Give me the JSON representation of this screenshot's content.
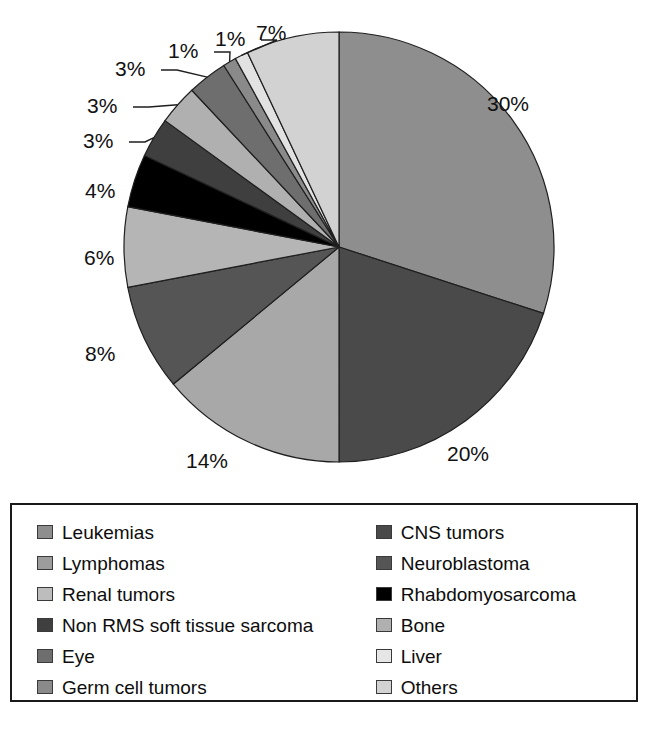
{
  "chart_data": {
    "type": "pie",
    "title": "",
    "subtitle": "",
    "xlabel": "",
    "ylabel": "",
    "grid": false,
    "legend_position": "bottom",
    "units": "percent",
    "start_angle_deg": 0,
    "direction": "clockwise",
    "categories": [
      "Leukemias",
      "CNS tumors",
      "Lymphomas",
      "Neuroblastoma",
      "Renal tumors",
      "Rhabdomyosarcoma",
      "Non RMS soft tissue sarcoma",
      "Bone",
      "Eye",
      "Germ cell tumors",
      "Liver",
      "Others"
    ],
    "values": [
      30,
      20,
      14,
      8,
      6,
      4,
      3,
      3,
      3,
      1,
      1,
      7
    ],
    "labels": [
      "30%",
      "20%",
      "14%",
      "8%",
      "6%",
      "4%",
      "3%",
      "3%",
      "3%",
      "1%",
      "1%",
      "7%"
    ],
    "colors": [
      "#8e8e8e",
      "#4a4a4a",
      "#a8a8a8",
      "#555555",
      "#b5b5b5",
      "#000000",
      "#3f3f3f",
      "#7a7a7a",
      "#6e6e6e",
      "#8a8a8a",
      "#e2e2e2",
      "#d2d2d2"
    ],
    "slices": [
      {
        "name": "Leukemias",
        "value": 30,
        "label": "30%",
        "color": "#8e8e8e"
      },
      {
        "name": "CNS tumors",
        "value": 20,
        "label": "20%",
        "color": "#4a4a4a"
      },
      {
        "name": "Lymphomas",
        "value": 14,
        "label": "14%",
        "color": "#a8a8a8"
      },
      {
        "name": "Neuroblastoma",
        "value": 8,
        "label": "8%",
        "color": "#555555"
      },
      {
        "name": "Renal tumors",
        "value": 6,
        "label": "6%",
        "color": "#b5b5b5"
      },
      {
        "name": "Rhabdomyosarcoma",
        "value": 4,
        "label": "4%",
        "color": "#000000"
      },
      {
        "name": "Non RMS soft tissue sarcoma",
        "value": 3,
        "label": "3%",
        "color": "#3f3f3f"
      },
      {
        "name": "Bone",
        "value": 3,
        "label": "3%",
        "color": "#b0b0b0"
      },
      {
        "name": "Eye",
        "value": 3,
        "label": "3%",
        "color": "#6e6e6e"
      },
      {
        "name": "Germ cell tumors",
        "value": 1,
        "label": "1%",
        "color": "#8a8a8a"
      },
      {
        "name": "Liver",
        "value": 1,
        "label": "1%",
        "color": "#e2e2e2"
      },
      {
        "name": "Others",
        "value": 7,
        "label": "7%",
        "color": "#d2d2d2"
      }
    ]
  },
  "pie": {
    "center_x": 339,
    "center_y": 247,
    "radius": 215,
    "outline_color": "#1f1f1f",
    "callout_labels": [
      {
        "text": "30%",
        "x": 487,
        "y": 93,
        "leader": false
      },
      {
        "text": "20%",
        "x": 447,
        "y": 443,
        "leader": false
      },
      {
        "text": "14%",
        "x": 186,
        "y": 450,
        "leader": false
      },
      {
        "text": "8%",
        "x": 85,
        "y": 343,
        "leader": false
      },
      {
        "text": "6%",
        "x": 84,
        "y": 247,
        "leader": false
      },
      {
        "text": "4%",
        "x": 85,
        "y": 180,
        "leader": false
      },
      {
        "text": "3%",
        "x": 83,
        "y": 130,
        "leader": true
      },
      {
        "text": "3%",
        "x": 87,
        "y": 95,
        "leader": true
      },
      {
        "text": "3%",
        "x": 115,
        "y": 58,
        "leader": true
      },
      {
        "text": "1%",
        "x": 168,
        "y": 40,
        "leader": true
      },
      {
        "text": "1%",
        "x": 215,
        "y": 28,
        "leader": true
      },
      {
        "text": "7%",
        "x": 256,
        "y": 22,
        "leader": false
      }
    ]
  },
  "legend": {
    "columns": [
      {
        "items": [
          {
            "label": "Leukemias",
            "color": "#8e8e8e"
          },
          {
            "label": "Lymphomas",
            "color": "#9d9d9d"
          },
          {
            "label": "Renal tumors",
            "color": "#bdbdbd"
          },
          {
            "label": "Non RMS soft tissue sarcoma",
            "color": "#3f3f3f"
          },
          {
            "label": "Eye",
            "color": "#6e6e6e"
          },
          {
            "label": "Germ cell tumors",
            "color": "#8a8a8a"
          }
        ]
      },
      {
        "items": [
          {
            "label": "CNS tumors",
            "color": "#4a4a4a"
          },
          {
            "label": "Neuroblastoma",
            "color": "#555555"
          },
          {
            "label": "Rhabdomyosarcoma",
            "color": "#000000"
          },
          {
            "label": "Bone",
            "color": "#b0b0b0"
          },
          {
            "label": "Liver",
            "color": "#e6e6e6"
          },
          {
            "label": "Others",
            "color": "#d2d2d2"
          }
        ]
      }
    ]
  }
}
